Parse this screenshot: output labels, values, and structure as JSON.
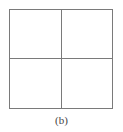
{
  "figure": {
    "caption": "(b)",
    "grid": {
      "rows": 2,
      "cols": 2
    },
    "line_color": "#7a7a7a"
  }
}
